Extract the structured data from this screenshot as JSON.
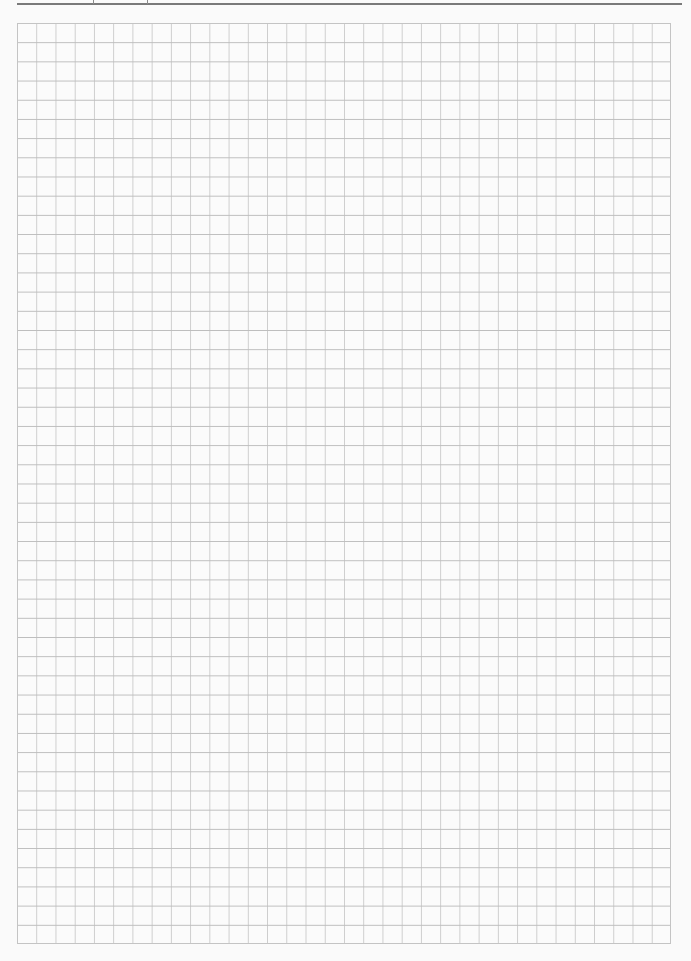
{
  "page": {
    "type": "graph-paper-worksheet",
    "background_color": "#fafafa"
  },
  "header": {
    "rule_color": "#7a7a7a",
    "fields": [
      {
        "left": 93,
        "width": 54
      }
    ]
  },
  "grid": {
    "columns": 34,
    "rows": 48,
    "cell_size_px": 19.2,
    "line_color_horizontal": "#bdbdbd",
    "line_color_vertical": "#cdcdcd",
    "border_color": "#c4c4c4"
  }
}
